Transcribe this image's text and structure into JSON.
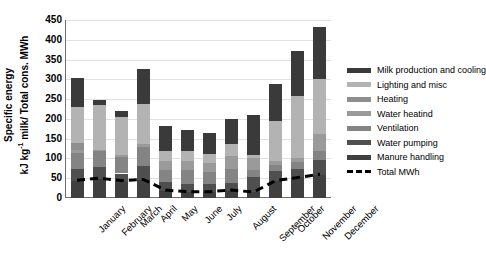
{
  "chart_data": {
    "type": "bar",
    "title": "",
    "subtitle": "",
    "stacked": true,
    "xlabel": "",
    "ylabel": "Specific energy kJ kg-1 milk/ Total cons. MWh",
    "ylabel_line1": "Specific energy",
    "ylabel_line2_pre": "kJ kg",
    "ylabel_line2_sup": "-1",
    "ylabel_line2_post": " milk/ Total cons. MWh",
    "ylim": [
      0,
      450
    ],
    "ytick_step": 50,
    "yticks": [
      450,
      400,
      350,
      300,
      250,
      200,
      150,
      100,
      50,
      0
    ],
    "grid": true,
    "legend_position": "right",
    "categories": [
      "January",
      "February",
      "March",
      "April",
      "May",
      "June",
      "July",
      "August",
      "September",
      "October",
      "November",
      "December"
    ],
    "series": [
      {
        "name": "Manure handling",
        "color": "#404040",
        "values": [
          42,
          48,
          40,
          46,
          18,
          14,
          14,
          18,
          16,
          42,
          52,
          58
        ]
      },
      {
        "name": "Water pumping",
        "color": "#4f4f4f",
        "values": [
          32,
          30,
          22,
          36,
          22,
          22,
          22,
          20,
          38,
          26,
          22,
          38
        ]
      },
      {
        "name": "Ventilation",
        "color": "#848484",
        "values": [
          40,
          42,
          42,
          46,
          32,
          34,
          30,
          36,
          18,
          16,
          16,
          22
        ]
      },
      {
        "name": "Water heatind",
        "color": "#9a9a9a",
        "values": [
          8,
          2,
          6,
          8,
          22,
          24,
          22,
          32,
          28,
          10,
          10,
          44
        ]
      },
      {
        "name": "Heating",
        "color": "#8e8e8e",
        "values": [
          18,
          0,
          0,
          0,
          0,
          0,
          0,
          0,
          0,
          0,
          0,
          0
        ]
      },
      {
        "name": "Lighting and misc",
        "color": "#b3b3b3",
        "values": [
          90,
          112,
          96,
          102,
          26,
          24,
          24,
          30,
          10,
          100,
          158,
          140
        ]
      },
      {
        "name": "Milk production and cooling",
        "color": "#3a3a3a",
        "values": [
          74,
          13,
          14,
          89,
          63,
          53,
          53,
          65,
          100,
          95,
          114,
          130
        ]
      }
    ],
    "bar_totals": [
      304,
      247,
      219,
      326,
      183,
      171,
      165,
      201,
      210,
      289,
      372,
      432
    ],
    "overlay_line": {
      "name": "Total MWh",
      "style": "dashed",
      "color": "#000000",
      "values": [
        45,
        50,
        44,
        47,
        20,
        16,
        16,
        20,
        15,
        44,
        52,
        60
      ]
    }
  },
  "legend": {
    "items": [
      {
        "label": "Milk production and cooling",
        "color": "#3a3a3a",
        "style": "solid"
      },
      {
        "label": "Lighting and misc",
        "color": "#b3b3b3",
        "style": "solid"
      },
      {
        "label": "Heating",
        "color": "#8e8e8e",
        "style": "solid"
      },
      {
        "label": "Water heatind",
        "color": "#9a9a9a",
        "style": "solid"
      },
      {
        "label": "Ventilation",
        "color": "#848484",
        "style": "solid"
      },
      {
        "label": "Water pumping",
        "color": "#4f4f4f",
        "style": "solid"
      },
      {
        "label": "Manure handling",
        "color": "#404040",
        "style": "solid"
      },
      {
        "label": "Total MWh",
        "color": "#000000",
        "style": "dashed"
      }
    ]
  }
}
